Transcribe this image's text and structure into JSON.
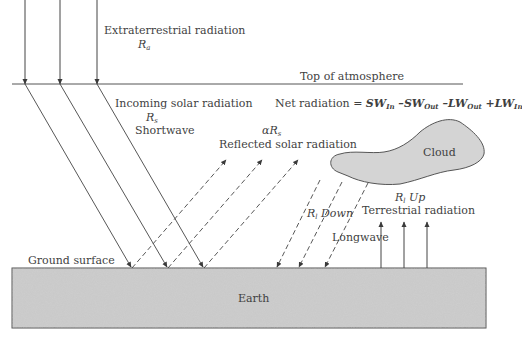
{
  "diagram": {
    "labels": {
      "extraterrestrial": "Extraterrestrial radiation",
      "ra_symbol": "R",
      "ra_sub": "a",
      "top_of_atmosphere": "Top of atmosphere",
      "incoming": "Incoming solar radiation",
      "rs_symbol": "R",
      "rs_sub": "s",
      "shortwave": "Shortwave",
      "net_radiation_prefix": "Net radiation = ",
      "net_terms": [
        {
          "sign": "",
          "base": "SW",
          "sub": "In"
        },
        {
          "sign": " –",
          "base": "SW",
          "sub": "Out"
        },
        {
          "sign": " –",
          "base": "LW",
          "sub": "Out"
        },
        {
          "sign": " +",
          "base": "LW",
          "sub": "In"
        }
      ],
      "alpha_rs": "αR",
      "alpha_rs_sub": "s",
      "reflected": "Reflected solar radiation",
      "cloud": "Cloud",
      "rl_up_symbol": "R",
      "rl_up_sub": "l",
      "rl_up_word": " Up",
      "terrestrial": "Terrestrial radiation",
      "rl_down_symbol": "R",
      "rl_down_sub": "l",
      "rl_down_word": " Down",
      "longwave": "Longwave",
      "ground_surface": "Ground surface",
      "earth": "Earth"
    },
    "colors": {
      "line": "#4a4a4a",
      "earth_fill": "#c6c6c6",
      "cloud_fill": "#d4d4d4",
      "text": "#3f3f3f"
    }
  }
}
